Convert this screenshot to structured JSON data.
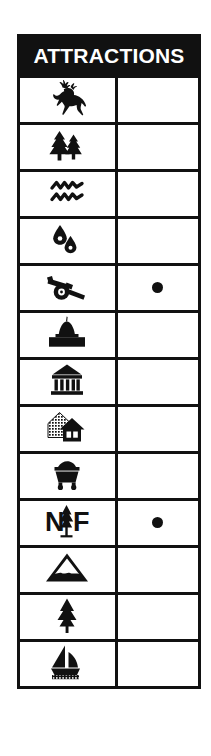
{
  "legend": {
    "title": "ATTRACTIONS",
    "header_bg": "#111111",
    "header_text_color": "#ffffff",
    "border_color": "#111111",
    "background": "#ffffff",
    "mark_symbol": "●",
    "columns": [
      {
        "key": "symbol",
        "header": ""
      },
      {
        "key": "mark",
        "header": ""
      }
    ],
    "rows": [
      {
        "icon": "deer-icon",
        "name": "Wildlife Viewing",
        "mark": ""
      },
      {
        "icon": "pine-trees-icon",
        "name": "Forest",
        "mark": ""
      },
      {
        "icon": "water-waves-icon",
        "name": "River Rapids",
        "mark": ""
      },
      {
        "icon": "water-drops-icon",
        "name": "Springs",
        "mark": ""
      },
      {
        "icon": "cannon-icon",
        "name": "Historic Battlefield",
        "mark": "●"
      },
      {
        "icon": "capitol-building-icon",
        "name": "State Capitol",
        "mark": ""
      },
      {
        "icon": "museum-icon",
        "name": "Museum",
        "mark": ""
      },
      {
        "icon": "historic-houses-icon",
        "name": "Historic Houses",
        "mark": ""
      },
      {
        "icon": "ore-cart-icon",
        "name": "Mine",
        "mark": ""
      },
      {
        "icon": "national-forest-icon",
        "name": "National Forest",
        "mark": "●"
      },
      {
        "icon": "mountain-icon",
        "name": "Mountain Peak",
        "mark": ""
      },
      {
        "icon": "single-tree-icon",
        "name": "Tree",
        "mark": ""
      },
      {
        "icon": "sailboat-icon",
        "name": "Boating",
        "mark": ""
      }
    ]
  }
}
